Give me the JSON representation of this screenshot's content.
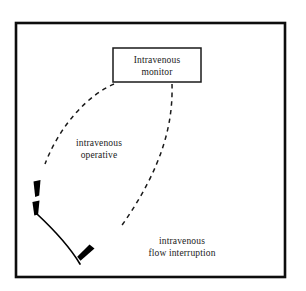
{
  "diagram": {
    "type": "causal-influence-diagram",
    "background_color": "#ffffff",
    "line_color": "#000000",
    "text_color": "#1a1a1a",
    "frame": {
      "name": "outer-border",
      "style": "solid rectangle border"
    },
    "nodes": [
      {
        "id": "intravenous-monitor",
        "label_line_1": "Intravenous",
        "label_line_2": "monitor",
        "shape": "rectangle",
        "style": "solid"
      }
    ],
    "edges": [
      {
        "id": "edge-intravenous-operative",
        "label_line_1": "intravenous",
        "label_line_2": "operative",
        "style": "dashed",
        "arrowhead": "filled-triangle",
        "from": "intravenous-monitor",
        "to": "left-arc-upper"
      },
      {
        "id": "edge-intravenous-flow-interruption",
        "label_line_1": "intravenous",
        "label_line_2": "flow interruption",
        "style": "dashed",
        "arrowhead": "filled-triangle",
        "from": "intravenous-monitor",
        "to": "lower-arc-end"
      }
    ],
    "arcs": [
      {
        "id": "solid-arc",
        "style": "solid",
        "description": "solid curved arc on lower left"
      }
    ],
    "arrowheads": [
      {
        "id": "arrowhead-upper-left",
        "points": "down-left"
      },
      {
        "id": "arrowhead-lower-left",
        "points": "down-left"
      },
      {
        "id": "arrowhead-arc-end",
        "points": "down-left"
      }
    ]
  }
}
